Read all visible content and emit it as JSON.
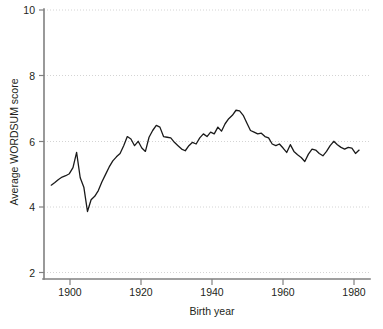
{
  "chart_data": {
    "type": "line",
    "title": "",
    "xlabel": "Birth year",
    "ylabel": "Average WORDSUM score",
    "xlim": [
      1894,
      1984
    ],
    "ylim": [
      2,
      10
    ],
    "xticks": [
      1900,
      1920,
      1940,
      1960,
      1980
    ],
    "yticks": [
      2,
      4,
      6,
      8,
      10
    ],
    "grid": "horizontal-dotted",
    "legend": "none",
    "line_color": "#1a1a1a",
    "grid_color": "#c9c9c9",
    "axis_color": "#808080",
    "series": [
      {
        "name": "Average WORDSUM score",
        "x": [
          1896,
          1897,
          1898,
          1899,
          1900,
          1901,
          1902,
          1903,
          1904,
          1905,
          1906,
          1907,
          1908,
          1909,
          1910,
          1911,
          1912,
          1913,
          1914,
          1915,
          1916,
          1917,
          1918,
          1919,
          1920,
          1921,
          1922,
          1923,
          1924,
          1925,
          1926,
          1927,
          1928,
          1929,
          1930,
          1931,
          1932,
          1933,
          1934,
          1935,
          1936,
          1937,
          1938,
          1939,
          1940,
          1941,
          1942,
          1943,
          1944,
          1945,
          1946,
          1947,
          1948,
          1949,
          1950,
          1951,
          1952,
          1953,
          1954,
          1955,
          1956,
          1957,
          1958,
          1959,
          1960,
          1961,
          1962,
          1963,
          1964,
          1965,
          1966,
          1967,
          1968,
          1969,
          1970,
          1971,
          1972,
          1973,
          1974,
          1975,
          1976,
          1977,
          1978,
          1979,
          1980,
          1981
        ],
        "y": [
          4.78,
          4.86,
          4.95,
          5.02,
          5.06,
          5.12,
          5.3,
          5.75,
          5.0,
          4.72,
          4.0,
          4.35,
          4.45,
          4.62,
          4.88,
          5.1,
          5.32,
          5.5,
          5.62,
          5.72,
          5.95,
          6.22,
          6.15,
          5.95,
          6.08,
          5.88,
          5.78,
          6.2,
          6.4,
          6.55,
          6.5,
          6.22,
          6.2,
          6.18,
          6.05,
          5.95,
          5.85,
          5.8,
          5.95,
          6.05,
          6.0,
          6.18,
          6.3,
          6.22,
          6.35,
          6.3,
          6.5,
          6.38,
          6.6,
          6.75,
          6.85,
          7.0,
          6.98,
          6.85,
          6.62,
          6.4,
          6.35,
          6.3,
          6.32,
          6.22,
          6.18,
          6.0,
          5.95,
          6.0,
          5.88,
          5.75,
          5.98,
          5.78,
          5.68,
          5.6,
          5.48,
          5.7,
          5.85,
          5.82,
          5.72,
          5.65,
          5.78,
          5.95,
          6.08,
          5.98,
          5.9,
          5.85,
          5.9,
          5.88,
          5.72,
          5.82
        ]
      }
    ]
  },
  "figure": {
    "caption_fragment": ""
  }
}
